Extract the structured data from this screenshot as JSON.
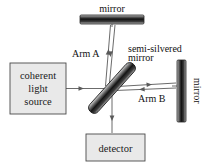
{
  "figure": {
    "width": 203,
    "height": 167,
    "background": "#ffffff"
  },
  "components": {
    "source_box": {
      "label_line1": "coherent",
      "label_line2": "light",
      "label_line3": "source",
      "fill": "#e9e9e9",
      "stroke": "#4a4a4a"
    },
    "detector_box": {
      "label": "detector",
      "fill": "#e9e9e9",
      "stroke": "#4a4a4a"
    },
    "top_mirror": {
      "label": "mirror",
      "orientation": "horizontal",
      "fill_dark": "#1b1b1b",
      "fill_light": "#c9c9c9"
    },
    "right_mirror": {
      "label": "mirror",
      "orientation": "vertical",
      "fill_dark": "#1b1b1b",
      "fill_light": "#c9c9c9"
    },
    "beamsplitter": {
      "label_line1": "semi-silvered",
      "label_line2": "mirror",
      "orientation": "diagonal-45",
      "fill_dark": "#151515",
      "fill_light": "#b8b8b8"
    }
  },
  "annotations": {
    "arm_a": "Arm A",
    "arm_b": "Arm B"
  },
  "beams": {
    "color": "#5a5a5a",
    "paths": [
      {
        "name": "source-to-beamsplitter",
        "direction": "right"
      },
      {
        "name": "beamsplitter-to-top-mirror",
        "direction": "up"
      },
      {
        "name": "top-mirror-to-beamsplitter",
        "direction": "down"
      },
      {
        "name": "beamsplitter-to-right-mirror",
        "direction": "right"
      },
      {
        "name": "right-mirror-to-beamsplitter",
        "direction": "left"
      },
      {
        "name": "beamsplitter-to-detector",
        "direction": "down"
      }
    ]
  }
}
